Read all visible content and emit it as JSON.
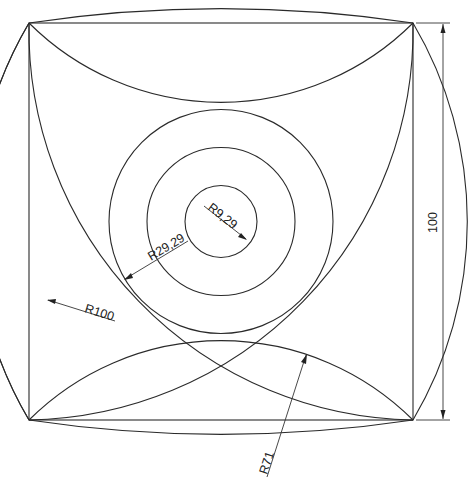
{
  "drawing": {
    "title": "Square with intersecting arcs and concentric circles",
    "square": {
      "x1": 29,
      "y1": 23,
      "x2": 413,
      "y2": 420
    },
    "center": {
      "cx": 221,
      "cy": 221.5
    },
    "circles": [
      {
        "name": "inner",
        "r": 36
      },
      {
        "name": "middle",
        "r": 74
      },
      {
        "name": "outer",
        "r": 112
      }
    ],
    "stroke_color": "#2a2a2a"
  },
  "dimensions": {
    "r_inner": "R9,29",
    "r_middle": "R29,29",
    "r_large": "R100",
    "r_arc": "R71",
    "height": "100"
  }
}
